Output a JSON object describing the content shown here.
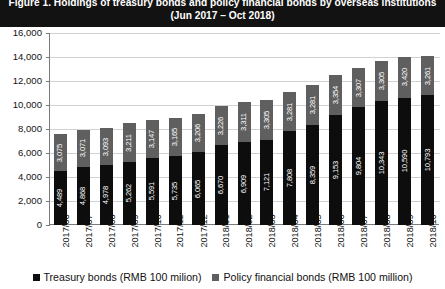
{
  "title": {
    "line1": "Figure 1.  Holdings of treasury bonds and policy financial bonds by overseas institutions",
    "line2": "(Jun 2017 – Oct 2018)"
  },
  "colors": {
    "treasury": "#0d0d0d",
    "policy": "#5f5f5f",
    "title_band": "#121212",
    "grid": "#d2d2d2",
    "axis": "#7b7b7b",
    "value_label": "#ffffff"
  },
  "legend": {
    "position": "bottom",
    "items": [
      {
        "label": "Treasury bonds (RMB 100 milion)",
        "color": "#0d0d0d"
      },
      {
        "label": "Policy financial bonds (RMB 100 million)",
        "color": "#5f5f5f"
      }
    ]
  },
  "chart_data": {
    "type": "bar",
    "stacked": true,
    "title": "Figure 1.  Holdings of treasury bonds and policy financial bonds by overseas institutions (Jun 2017 – Oct 2018)",
    "xlabel": "",
    "ylabel": "",
    "ylim": [
      0,
      16000
    ],
    "yticks": [
      "0",
      "2,000",
      "4,000",
      "6,000",
      "8,000",
      "10,000",
      "12,000",
      "14,000",
      "16,000"
    ],
    "ytick_values": [
      0,
      2000,
      4000,
      6000,
      8000,
      10000,
      12000,
      14000,
      16000
    ],
    "grid": true,
    "categories": [
      "2017/06",
      "2017/07",
      "2017/08",
      "2017/09",
      "2017/10",
      "2017/11",
      "2017/12",
      "2018/01",
      "2018/02",
      "2018/03",
      "2018/04",
      "2018/05",
      "2018/06",
      "2018/07",
      "2018/08",
      "2018/09",
      "2018/10"
    ],
    "series": [
      {
        "name": "Treasury bonds (RMB 100 milion)",
        "color": "#0d0d0d",
        "values": [
          4489,
          4868,
          4978,
          5262,
          5591,
          5735,
          6065,
          6670,
          6909,
          7121,
          7808,
          8359,
          9153,
          9804,
          10343,
          10590,
          10793
        ],
        "labels": [
          "4,489",
          "4,868",
          "4,978",
          "5,262",
          "5,591",
          "5,735",
          "6,065",
          "6,670",
          "6,909",
          "7,121",
          "7,808",
          "8,359",
          "9,153",
          "9,804",
          "10,343",
          "10,590",
          "10,793"
        ]
      },
      {
        "name": "Policy financial bonds (RMB 100 million)",
        "color": "#5f5f5f",
        "values": [
          3075,
          3071,
          3093,
          3211,
          3147,
          3165,
          3206,
          3226,
          3311,
          3305,
          3281,
          3281,
          3354,
          3307,
          3305,
          3420,
          3261
        ],
        "labels": [
          "3,075",
          "3,071",
          "3,093",
          "3,211",
          "3,147",
          "3,165",
          "3,206",
          "3,226",
          "3,311",
          "3,305",
          "3,281",
          "3,281",
          "3,354",
          "3,307",
          "3,305",
          "3,420",
          "3,261"
        ]
      }
    ]
  }
}
